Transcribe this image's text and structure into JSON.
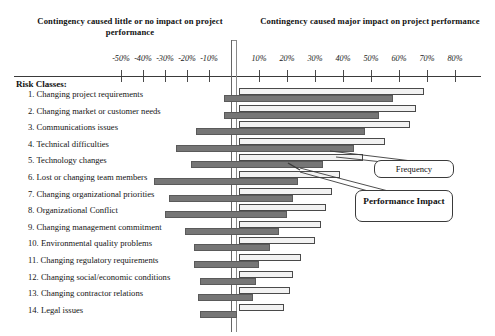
{
  "header": {
    "left_caption": "Contingency caused little or no impact on project performance",
    "right_caption": "Contingency caused major impact on project performance"
  },
  "risk_heading": "Risk Classes:",
  "callouts": {
    "frequency": "Frequency",
    "performance_impact": "Performance Impact"
  },
  "chart_data": {
    "type": "bar",
    "title": "",
    "subtitle": "",
    "orientation": "horizontal",
    "grid": false,
    "legend_position": "inline-callouts",
    "xlabel": "",
    "ylabel": "Risk Classes",
    "xlim": [
      -55,
      85
    ],
    "axis_note": "Left half (negative, little/no impact) is compressed relative to right half (positive, major impact)",
    "tick_labels": [
      "-50%",
      "-40%",
      "-30%",
      "-20%",
      "-10%",
      "10%",
      "20%",
      "30%",
      "40%",
      "50%",
      "60%",
      "70%",
      "80%"
    ],
    "tick_values": [
      -50,
      -40,
      -30,
      -20,
      -10,
      10,
      20,
      30,
      40,
      50,
      60,
      70,
      80
    ],
    "categories": [
      "1. Changing project requirements",
      "2. Changing market or customer needs",
      "3. Communications issues",
      "4. Technical difficulties",
      "5. Technology changes",
      "6. Lost or changing team members",
      "7. Changing organizational priorities",
      "8. Organizational Conflict",
      "9. Changing management commitment",
      "10. Environmental quality problems",
      "11. Changing regulatory requirements",
      "12. Changing social/economic conditions",
      "13. Changing contractor relations",
      "14. Legal issues"
    ],
    "series": [
      {
        "name": "Frequency",
        "color": "#f2f2f2",
        "style": "open-outline",
        "values": [
          69,
          66,
          64,
          55,
          47,
          39,
          36,
          34,
          32,
          30,
          25,
          22,
          21,
          19
        ],
        "starts": [
          3,
          3,
          3,
          3,
          3,
          3,
          3,
          3,
          3,
          3,
          3,
          3,
          3,
          3
        ]
      },
      {
        "name": "Performance Impact",
        "color": "#767676",
        "style": "filled",
        "values": [
          58,
          53,
          48,
          44,
          33,
          24,
          22,
          20,
          17,
          14,
          10,
          9,
          8,
          2
        ],
        "starts": [
          -3,
          -3,
          -16,
          -25,
          -18,
          -35,
          -28,
          -30,
          -21,
          -17,
          -17,
          -14,
          -15,
          -14
        ]
      }
    ]
  }
}
